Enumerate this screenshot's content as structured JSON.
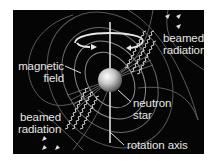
{
  "figure": {
    "background_color": "#050505",
    "line_color": "#d8d8d8",
    "field_line_color": "#8a8a8a",
    "labels": {
      "beamed_radiation_top": [
        "beamed",
        "radiation"
      ],
      "magnetic_field": [
        "magnetic",
        "field"
      ],
      "neutron_star": [
        "neutron",
        "star"
      ],
      "beamed_radiation_bottom": [
        "beamed",
        "radiation"
      ],
      "rotation_axis": "rotation axis"
    },
    "icons": {
      "rotation_arrow": "rotation-arrow-icon",
      "radiation_waves": "wavy-arrow-icon",
      "star": "sphere-icon"
    }
  }
}
